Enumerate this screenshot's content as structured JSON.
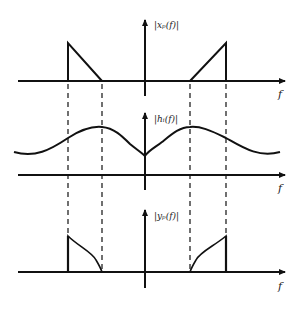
{
  "figure": {
    "panels": [
      {
        "id": "xp",
        "ylabel": "|x_p(f)|",
        "ylabel_display": "|xₚ(f)|",
        "xlabel": "f"
      },
      {
        "id": "hi",
        "ylabel": "|h_i(f)|",
        "ylabel_display": "|hᵢ(f)|",
        "xlabel": "f"
      },
      {
        "id": "yp",
        "ylabel": "|y_p(f)|",
        "ylabel_display": "|yₚ(f)|",
        "xlabel": "f"
      }
    ],
    "caption": ""
  }
}
